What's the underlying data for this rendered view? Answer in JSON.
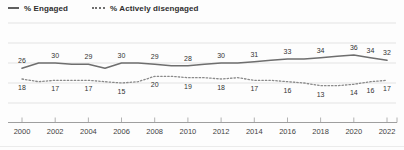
{
  "legend": {
    "items": [
      {
        "label": "% Engaged",
        "swatch": "solid-line"
      },
      {
        "label": "% Actively disengaged",
        "swatch": "dotted-line"
      }
    ]
  },
  "chart_data": {
    "type": "line",
    "title": "",
    "x": [
      2000,
      2001,
      2002,
      2003,
      2004,
      2005,
      2006,
      2007,
      2008,
      2009,
      2010,
      2011,
      2012,
      2013,
      2014,
      2015,
      2016,
      2017,
      2018,
      2019,
      2020,
      2021,
      2022
    ],
    "x_tick_labels": [
      "2000",
      "2002",
      "2004",
      "2006",
      "2008",
      "2010",
      "2012",
      "2014",
      "2016",
      "2018",
      "2020",
      "2022"
    ],
    "x_tick_years": [
      2000,
      2002,
      2004,
      2006,
      2008,
      2010,
      2012,
      2014,
      2016,
      2018,
      2020,
      2022
    ],
    "label_years": [
      2000,
      2002,
      2004,
      2006,
      2008,
      2010,
      2012,
      2014,
      2016,
      2018,
      2020,
      2021,
      2022
    ],
    "series": [
      {
        "name": "% Engaged",
        "line_style": "solid",
        "color": "#6e6e6e",
        "label_position": "above",
        "values": [
          26,
          30,
          30,
          29,
          29,
          26,
          30,
          30,
          29,
          28,
          28,
          29,
          30,
          30,
          31,
          32,
          33,
          33,
          34,
          35,
          36,
          34,
          32
        ],
        "labels": [
          26,
          30,
          29,
          30,
          29,
          28,
          30,
          31,
          33,
          34,
          36,
          34,
          32
        ]
      },
      {
        "name": "% Actively disengaged",
        "line_style": "dotted",
        "color": "#8a8a8a",
        "label_position": "below",
        "values": [
          18,
          16,
          17,
          17,
          17,
          16,
          15,
          16,
          20,
          20,
          19,
          19,
          18,
          19,
          17,
          17,
          16,
          15,
          13,
          13,
          14,
          16,
          17
        ],
        "labels": [
          18,
          17,
          17,
          15,
          20,
          19,
          18,
          17,
          16,
          13,
          14,
          16,
          17
        ]
      }
    ],
    "ylim": [
      0,
      60
    ],
    "y_gridlines_at": [
      0,
      15,
      30,
      45,
      60
    ],
    "y_axis_labels_shown": false,
    "grid": "horizontal",
    "legend_position": "top-left"
  },
  "colors": {
    "background": "#fdfdfd",
    "gridline": "#dcdcdc",
    "axis": "#9f9f9f",
    "data_label": "#333333",
    "tick_label": "#3f3f3f",
    "engaged_line": "#6e6e6e",
    "disengaged_line": "#8a8a8a"
  }
}
